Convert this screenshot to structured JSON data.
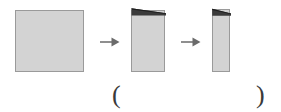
{
  "figure": {
    "caption_open": "(",
    "caption_close": ")",
    "background_color": "#ffffff",
    "paper_fill_color": "#d3d3d3",
    "paper_border_color": "#9a9a9a",
    "fold_flap_color": "#3b3b3b",
    "arrow_color": "#6b6b6b"
  },
  "sequence": {
    "steps": [
      {
        "name": "unfolded-square-sheet",
        "label": "square sheet of paper",
        "width_px": 69,
        "height_px": 62
      },
      {
        "name": "sheet-folded-once",
        "label": "paper folded in half vertically",
        "width_px": 34,
        "height_px": 62
      },
      {
        "name": "sheet-folded-twice",
        "label": "paper folded in half again",
        "width_px": 18,
        "height_px": 63
      }
    ],
    "arrows": [
      {
        "name": "arrow-step-1-to-2",
        "glyph": "right-arrow-icon"
      },
      {
        "name": "arrow-step-2-to-3",
        "glyph": "right-arrow-icon"
      }
    ]
  },
  "answer": {
    "open_paren": "(",
    "close_paren": ")",
    "value": ""
  }
}
